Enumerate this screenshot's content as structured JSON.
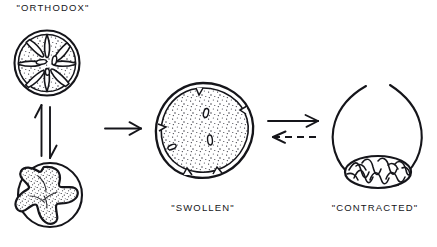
{
  "figure": {
    "background_color": "#ffffff",
    "ink_color": "#15151a",
    "width": 437,
    "height": 247
  },
  "labels": {
    "orthodox": "\"ORTHODOX\"",
    "swollen": "\"SWOLLEN\"",
    "contracted": "\"CONTRACTED\""
  },
  "states": [
    {
      "id": "orthodox",
      "label": "\"ORTHODOX\"",
      "position": "top-left",
      "shape": "round mitochondrion with radial cristae and stippled matrix"
    },
    {
      "id": "condensed",
      "label": "",
      "position": "bottom-left",
      "shape": "round outer membrane enclosing condensed pinwheel-shaped dense matrix"
    },
    {
      "id": "swollen",
      "label": "\"SWOLLEN\"",
      "position": "center",
      "shape": "large round double-membraned profile with finely stippled matrix and few vesicular cristae"
    },
    {
      "id": "contracted",
      "label": "\"CONTRACTED\"",
      "position": "right",
      "shape": "open-topped rounded outline with dense scribbled mass at base"
    }
  ],
  "arrows": [
    {
      "id": "orthodox-condensed-equilibrium",
      "style": "solid",
      "form": "double half-arrow equilibrium",
      "orientation": "vertical",
      "from": "orthodox",
      "to": "condensed"
    },
    {
      "id": "orthodox-to-swollen",
      "style": "solid",
      "form": "single arrow",
      "orientation": "horizontal",
      "direction": "right",
      "from": "orthodox",
      "to": "swollen"
    },
    {
      "id": "swollen-to-contracted",
      "style": "solid",
      "form": "single arrow",
      "orientation": "horizontal",
      "direction": "right",
      "from": "swollen",
      "to": "contracted"
    },
    {
      "id": "contracted-to-swollen",
      "style": "dashed",
      "form": "single arrow",
      "orientation": "horizontal",
      "direction": "left",
      "from": "contracted",
      "to": "swollen"
    }
  ]
}
